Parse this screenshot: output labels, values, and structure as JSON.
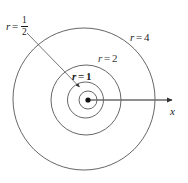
{
  "figure": {
    "type": "polar-coordinate-diagram",
    "background_color": "#ffffff",
    "stroke_color": "#4a4a4a",
    "axis_color": "#555555",
    "text_color": "#1a1a1a",
    "labels": {
      "r_half": {
        "var": "r",
        "eq": "=",
        "numerator": "1",
        "denominator": "2"
      },
      "r_one": {
        "var": "r",
        "eq": "=",
        "value": "1"
      },
      "r_two": {
        "var": "r",
        "eq": "=",
        "value": "2"
      },
      "r_four": {
        "var": "r",
        "eq": "=",
        "value": "4"
      },
      "axis_x": "x"
    },
    "circles": [
      {
        "name": "circle-r-half",
        "r_value": "1/2",
        "cx": 88,
        "cy": 100,
        "radius": 9
      },
      {
        "name": "circle-r-1",
        "r_value": "1",
        "cx": 85,
        "cy": 100,
        "radius": 18
      },
      {
        "name": "circle-r-2",
        "r_value": "2",
        "cx": 86,
        "cy": 100,
        "radius": 35
      },
      {
        "name": "circle-r-4",
        "r_value": "4",
        "cx": 84,
        "cy": 99,
        "radius": 71
      }
    ],
    "origin_point": {
      "cx": 88,
      "cy": 100,
      "radius": 2.6
    },
    "x_axis": {
      "from_x": 88,
      "to_x": 177,
      "y": 100,
      "arrow": "right"
    },
    "leader_line": {
      "from_x": 27,
      "from_y": 33,
      "to_x": 81,
      "to_y": 88,
      "arrow": "end"
    }
  }
}
